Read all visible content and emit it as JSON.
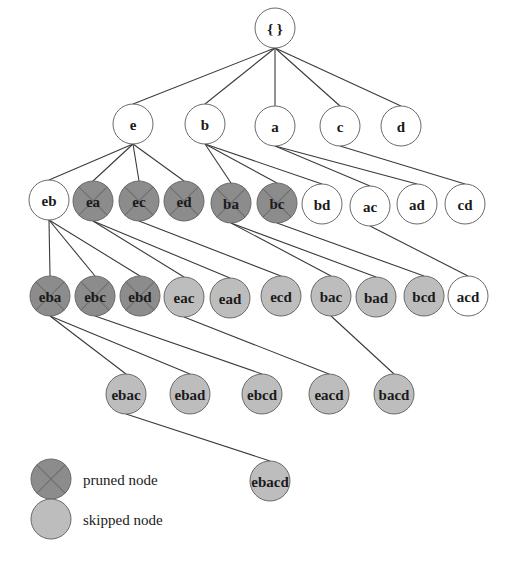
{
  "colors": {
    "normal": "#ffffff",
    "pruned": "#8c8c8c",
    "skipped": "#bdbdbd",
    "edge": "#3a3a3a",
    "prune_mark": "#6f6f6f"
  },
  "radius": 20,
  "nodes": [
    {
      "id": "root",
      "label": "{ }",
      "x": 275,
      "y": 28,
      "state": "normal"
    },
    {
      "id": "e",
      "label": "e",
      "x": 133,
      "y": 124,
      "state": "normal"
    },
    {
      "id": "b",
      "label": "b",
      "x": 205,
      "y": 124,
      "state": "normal"
    },
    {
      "id": "a",
      "label": "a",
      "x": 275,
      "y": 126,
      "state": "normal"
    },
    {
      "id": "c",
      "label": "c",
      "x": 340,
      "y": 126,
      "state": "normal"
    },
    {
      "id": "d",
      "label": "d",
      "x": 401,
      "y": 126,
      "state": "normal"
    },
    {
      "id": "eb",
      "label": "eb",
      "x": 49,
      "y": 200,
      "state": "normal"
    },
    {
      "id": "ea",
      "label": "ea",
      "x": 93,
      "y": 201,
      "state": "pruned"
    },
    {
      "id": "ec",
      "label": "ec",
      "x": 139,
      "y": 201,
      "state": "pruned"
    },
    {
      "id": "ed",
      "label": "ed",
      "x": 184,
      "y": 201,
      "state": "pruned"
    },
    {
      "id": "ba",
      "label": "ba",
      "x": 231,
      "y": 203,
      "state": "pruned"
    },
    {
      "id": "bc",
      "label": "bc",
      "x": 277,
      "y": 203,
      "state": "pruned"
    },
    {
      "id": "bd",
      "label": "bd",
      "x": 322,
      "y": 204,
      "state": "normal"
    },
    {
      "id": "ac",
      "label": "ac",
      "x": 370,
      "y": 206,
      "state": "normal"
    },
    {
      "id": "ad",
      "label": "ad",
      "x": 417,
      "y": 204,
      "state": "normal"
    },
    {
      "id": "cd",
      "label": "cd",
      "x": 465,
      "y": 204,
      "state": "normal"
    },
    {
      "id": "eba",
      "label": "eba",
      "x": 50,
      "y": 296,
      "state": "pruned"
    },
    {
      "id": "ebc",
      "label": "ebc",
      "x": 95,
      "y": 296,
      "state": "pruned"
    },
    {
      "id": "ebd",
      "label": "ebd",
      "x": 140,
      "y": 296,
      "state": "pruned"
    },
    {
      "id": "eac",
      "label": "eac",
      "x": 184,
      "y": 297,
      "state": "skipped"
    },
    {
      "id": "ead",
      "label": "ead",
      "x": 230,
      "y": 298,
      "state": "skipped"
    },
    {
      "id": "ecd",
      "label": "ecd",
      "x": 281,
      "y": 296,
      "state": "skipped"
    },
    {
      "id": "bac",
      "label": "bac",
      "x": 331,
      "y": 296,
      "state": "skipped"
    },
    {
      "id": "bad",
      "label": "bad",
      "x": 376,
      "y": 297,
      "state": "skipped"
    },
    {
      "id": "bcd",
      "label": "bcd",
      "x": 424,
      "y": 296,
      "state": "skipped"
    },
    {
      "id": "acd",
      "label": "acd",
      "x": 468,
      "y": 296,
      "state": "normal"
    },
    {
      "id": "ebac",
      "label": "ebac",
      "x": 126,
      "y": 394,
      "state": "skipped"
    },
    {
      "id": "ebad",
      "label": "ebad",
      "x": 190,
      "y": 394,
      "state": "skipped"
    },
    {
      "id": "ebcd",
      "label": "ebcd",
      "x": 262,
      "y": 394,
      "state": "skipped"
    },
    {
      "id": "eacd",
      "label": "eacd",
      "x": 329,
      "y": 394,
      "state": "skipped"
    },
    {
      "id": "bacd",
      "label": "bacd",
      "x": 394,
      "y": 394,
      "state": "skipped"
    },
    {
      "id": "ebacd",
      "label": "ebacd",
      "x": 270,
      "y": 481,
      "state": "skipped"
    }
  ],
  "edges": [
    [
      "root",
      "e"
    ],
    [
      "root",
      "b"
    ],
    [
      "root",
      "a"
    ],
    [
      "root",
      "c"
    ],
    [
      "root",
      "d"
    ],
    [
      "e",
      "eb"
    ],
    [
      "e",
      "ea"
    ],
    [
      "e",
      "ec"
    ],
    [
      "e",
      "ed"
    ],
    [
      "b",
      "ba"
    ],
    [
      "b",
      "bc"
    ],
    [
      "b",
      "bd"
    ],
    [
      "a",
      "ac"
    ],
    [
      "a",
      "ad"
    ],
    [
      "c",
      "cd"
    ],
    [
      "eb",
      "eba"
    ],
    [
      "eb",
      "ebc"
    ],
    [
      "eb",
      "ebd"
    ],
    [
      "ea",
      "eac"
    ],
    [
      "ea",
      "ead"
    ],
    [
      "ec",
      "ecd"
    ],
    [
      "ba",
      "bac"
    ],
    [
      "ba",
      "bad"
    ],
    [
      "bc",
      "bcd"
    ],
    [
      "ac",
      "acd"
    ],
    [
      "eba",
      "ebac"
    ],
    [
      "eba",
      "ebad"
    ],
    [
      "ebc",
      "ebcd"
    ],
    [
      "eac",
      "eacd"
    ],
    [
      "bac",
      "bacd"
    ],
    [
      "ebac",
      "ebacd"
    ]
  ],
  "legend": {
    "items": [
      {
        "state": "pruned",
        "label": "pruned node",
        "x": 51,
        "y": 479
      },
      {
        "state": "skipped",
        "label": "skipped node",
        "x": 51,
        "y": 519
      }
    ],
    "text_x": 83
  }
}
